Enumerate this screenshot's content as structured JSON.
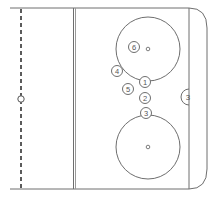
{
  "diagram": {
    "type": "hockey-rink-zone",
    "colors": {
      "background": "#ffffff",
      "lines": "#6e6e6e",
      "dashed_line": "#333333"
    },
    "markers": [
      {
        "id": "6",
        "label": "6",
        "x": 134,
        "y": 47
      },
      {
        "id": "4",
        "label": "4",
        "x": 117,
        "y": 71
      },
      {
        "id": "1",
        "label": "1",
        "x": 145,
        "y": 82
      },
      {
        "id": "5",
        "label": "5",
        "x": 128,
        "y": 89
      },
      {
        "id": "2",
        "label": "2",
        "x": 145,
        "y": 98
      },
      {
        "id": "3",
        "label": "3",
        "x": 146,
        "y": 113
      }
    ],
    "crease_label": "3"
  }
}
